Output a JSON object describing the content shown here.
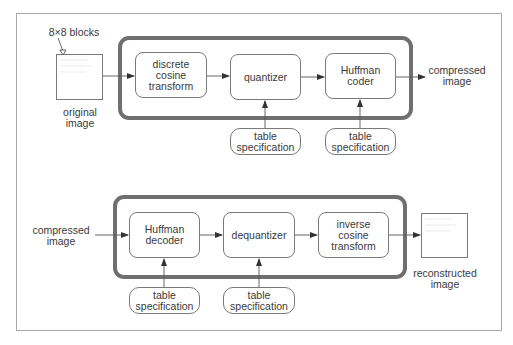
{
  "diagram": {
    "encoder": {
      "annotation": "8×8 blocks",
      "input": {
        "line1": "original",
        "line2": "image"
      },
      "blocks": [
        {
          "lines": [
            "discrete",
            "cosine",
            "transform"
          ]
        },
        {
          "lines": [
            "quantizer"
          ]
        },
        {
          "lines": [
            "Huffman",
            "coder"
          ]
        }
      ],
      "specs": [
        {
          "line1": "table",
          "line2": "specification"
        },
        {
          "line1": "table",
          "line2": "specification"
        }
      ],
      "output": {
        "line1": "compressed",
        "line2": "image"
      }
    },
    "decoder": {
      "input": {
        "line1": "compressed",
        "line2": "image"
      },
      "blocks": [
        {
          "lines": [
            "Huffman",
            "decoder"
          ]
        },
        {
          "lines": [
            "dequantizer"
          ]
        },
        {
          "lines": [
            "inverse",
            "cosine",
            "transform"
          ]
        }
      ],
      "specs": [
        {
          "line1": "table",
          "line2": "specification"
        },
        {
          "line1": "table",
          "line2": "specification"
        }
      ],
      "output": {
        "line1": "reconstructed",
        "line2": "image"
      }
    },
    "colors": {
      "stage_border": "#6f6f6f",
      "block_border": "#7a7a7a",
      "frame_border": "#a8a8a8",
      "text": "#3a3a3a"
    }
  }
}
